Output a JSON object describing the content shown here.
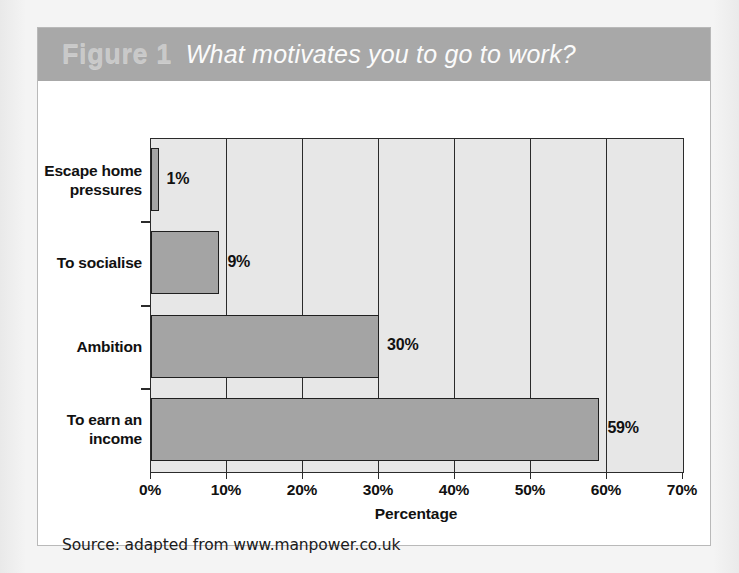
{
  "figure": {
    "number_label": "Figure 1",
    "title": "What motivates you to go to work?",
    "source_note": "Source: adapted from www.manpower.co.uk",
    "banner_color": "#a8a8a8",
    "plot_bg_color": "#e7e7e7",
    "bar_fill_color": "#a4a4a4",
    "bar_border_color": "#1f1f1f",
    "axis_color": "#2b2b2b",
    "card_bg_color": "#ffffff",
    "page_bg_color": "#f3f3f3"
  },
  "chart_data": {
    "type": "bar",
    "orientation": "horizontal",
    "title": "What motivates you to go to work?",
    "xlabel": "Percentage",
    "ylabel": "",
    "xlim": [
      0,
      70
    ],
    "xticks": [
      0,
      10,
      20,
      30,
      40,
      50,
      60,
      70
    ],
    "xticklabels": [
      "0%",
      "10%",
      "20%",
      "30%",
      "40%",
      "50%",
      "60%",
      "70%"
    ],
    "grid": "vertical",
    "legend": "none",
    "categories": [
      "Escape home pressures",
      "To socialise",
      "Ambition",
      "To earn an income"
    ],
    "values": [
      1,
      9,
      30,
      59
    ],
    "data_labels": [
      "1%",
      "9%",
      "30%",
      "59%"
    ],
    "source": "adapted from www.manpower.co.uk"
  }
}
